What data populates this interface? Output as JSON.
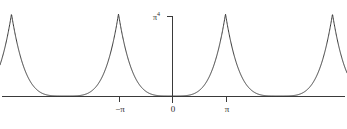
{
  "figure": {
    "background_color": "#ffffff",
    "curve_color": "#3a3a3a",
    "axis_color": "#3a3a3a"
  },
  "axes": {
    "y_axis_top_label": "π",
    "y_axis_top_label_exponent": "4",
    "x_tick_labels": [
      "−π",
      "0",
      "π"
    ],
    "origin_label": "0"
  },
  "chart_data": {
    "type": "line",
    "title": "",
    "subtitle": "",
    "xlabel": "",
    "ylabel": "π⁴",
    "xlim": [
      -3.2,
      3.2
    ],
    "ylim": [
      0,
      1.06
    ],
    "grid": false,
    "legend": null,
    "x_ticks": [
      -3.141592653589793,
      0,
      3.141592653589793
    ],
    "x_tick_labels": [
      "−π",
      "0",
      "π"
    ],
    "y_ticks": [
      1
    ],
    "y_tick_labels": [
      "π⁴"
    ],
    "annotations": [],
    "series": [
      {
        "name": "periodic x^4 extension",
        "description": "Even 2π-periodic extension of y = x^4 on [-π, π], normalized so peaks reach π^4; cusped maxima at odd multiples of π, zeros at even multiples of π.",
        "period": 6.283185307179586,
        "peak_value": 1,
        "peak_x_positions": [
          -3.141592653589793,
          3.141592653589793,
          -9.42477796076938,
          9.42477796076938
        ],
        "zero_x_positions": [
          -6.283185307179586,
          0,
          6.283185307179586
        ],
        "exponent": 4
      }
    ]
  },
  "geometry": {
    "x_axis_y_px": 96,
    "y_axis_x_px": 172,
    "y_axis_top_px": 16,
    "px_per_pi": 53.5,
    "peak_top_px": 14,
    "tick_length_px": 5,
    "width_px": 347,
    "height_px": 129
  }
}
